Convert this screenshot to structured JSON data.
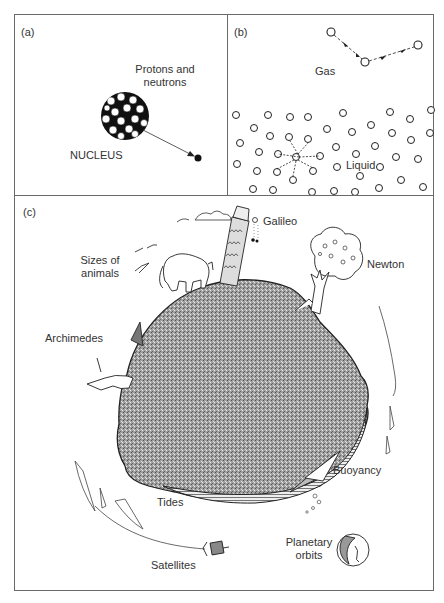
{
  "figure": {
    "panels": [
      {
        "id": "a",
        "tag": "(a)",
        "labels": {
          "particles": "Protons and\nneutrons",
          "particles_line1": "Protons and",
          "particles_line2": "neutrons",
          "nucleus": "NUCLEUS"
        }
      },
      {
        "id": "b",
        "tag": "(b)",
        "labels": {
          "gas": "Gas",
          "liquid": "Liquid"
        }
      },
      {
        "id": "c",
        "tag": "(c)",
        "labels": {
          "galileo": "Galileo",
          "newton": "Newton",
          "sizes_line1": "Sizes of",
          "sizes_line2": "animals",
          "archimedes": "Archimedes",
          "buoyancy": "Buoyancy",
          "tides": "Tides",
          "satellites": "Satellites",
          "planetary_line1": "Planetary",
          "planetary_line2": "orbits"
        }
      }
    ]
  },
  "colors": {
    "border": "#6a6a6a",
    "ink": "#2a2a2a",
    "earth": "#9a9a9a",
    "earth_dark": "#7d7d7d"
  }
}
